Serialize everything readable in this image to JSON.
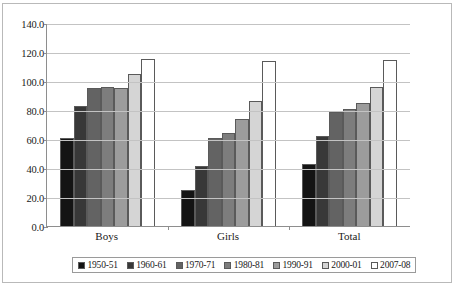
{
  "chart_data": {
    "type": "bar",
    "title": "",
    "xlabel": "",
    "ylabel": "",
    "categories": [
      "Boys",
      "Girls",
      "Total"
    ],
    "ylim": [
      0.0,
      140.0
    ],
    "ytick_step": 20.0,
    "ytick_labels": [
      "140.0",
      "120.0",
      "100.0",
      "80.0",
      "60.0",
      "40.0",
      "20.0",
      "0.0"
    ],
    "ytick_values": [
      140.0,
      120.0,
      100.0,
      80.0,
      60.0,
      40.0,
      20.0,
      0.0
    ],
    "grid": true,
    "legend_position": "bottom",
    "series": [
      {
        "name": "1950-51",
        "color": "#141414",
        "values": [
          60.6,
          24.8,
          42.6
        ]
      },
      {
        "name": "1960-61",
        "color": "#383838",
        "values": [
          82.6,
          41.4,
          62.4
        ]
      },
      {
        "name": "1970-71",
        "color": "#636363",
        "values": [
          95.5,
          60.5,
          78.6
        ]
      },
      {
        "name": "1980-81",
        "color": "#7d7d7d",
        "values": [
          95.8,
          64.1,
          80.5
        ]
      },
      {
        "name": "1990-91",
        "color": "#9c9c9c",
        "values": [
          94.9,
          73.5,
          84.5
        ]
      },
      {
        "name": "2000-01",
        "color": "#d5d5d5",
        "values": [
          104.9,
          85.9,
          95.7
        ]
      },
      {
        "name": "2007-08",
        "color": "#ffffff",
        "values": [
          115.5,
          113.5,
          114.6
        ]
      }
    ]
  },
  "colors": {
    "gridline": "#c3c3c3",
    "axis": "#8e8e8e",
    "frame": "#b9b9b9",
    "text": "#1a1a1a"
  }
}
